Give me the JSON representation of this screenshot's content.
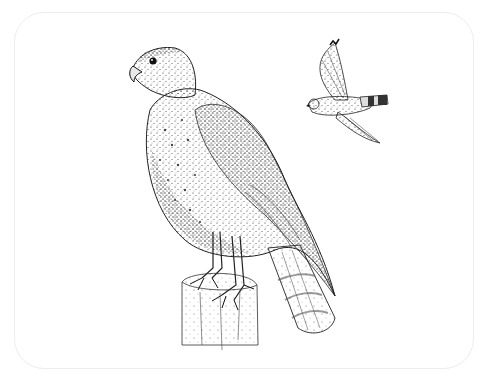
{
  "image": {
    "description": "Pen-and-ink stipple illustration of a hawk perched on a wooden post, with a smaller hawk in flight at upper right",
    "subjects": [
      {
        "name": "perched-hawk",
        "pose": "standing on post, facing left",
        "features": [
          "hooked beak",
          "dark eye",
          "spotted breast",
          "long banded tail"
        ]
      },
      {
        "name": "flying-hawk",
        "pose": "in flight, wings raised and lowered",
        "features": [
          "barred wings",
          "banded dark-tipped tail"
        ]
      },
      {
        "name": "wooden-post",
        "pose": "vertical, cut top"
      }
    ],
    "colors": {
      "background": "#ffffff",
      "ink": "#1a1a1a",
      "frame": "#ededed",
      "shade": "#6b6b6b"
    }
  }
}
